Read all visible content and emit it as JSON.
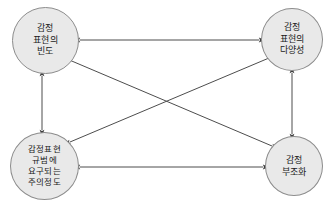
{
  "figure": {
    "type": "node-edge-diagram",
    "background_color": "#ffffff",
    "node_fill_color": "#e9e9e9",
    "node_border_color": "#8c8c8c",
    "edge_color": "#4d4d4d"
  },
  "nodes": [
    {
      "id": "frequency",
      "name": "감정 표현의 빈도",
      "lines": [
        "감정",
        "표현의",
        "빈도"
      ],
      "position": "top-left"
    },
    {
      "id": "variety",
      "name": "감정 표현의 다양성",
      "lines": [
        "감정",
        "표현의",
        "다양성"
      ],
      "position": "top-right"
    },
    {
      "id": "attention",
      "name": "감정표현 규범에 요구되는 주의정도",
      "lines": [
        "감정표현",
        "규범에",
        "요구되는",
        "주의정도"
      ],
      "position": "bottom-left"
    },
    {
      "id": "dissonance",
      "name": "감정 부조화",
      "lines": [
        "감정",
        "부조화"
      ],
      "position": "bottom-right"
    }
  ],
  "edges": [
    {
      "id": "frequency-variety",
      "from": "frequency",
      "to": "variety",
      "arrow": "double",
      "x1": 80,
      "y1": 40,
      "x2": 259,
      "y2": 40
    },
    {
      "id": "attention-dissonance",
      "from": "attention",
      "to": "dissonance",
      "arrow": "double",
      "x1": 80,
      "y1": 167,
      "x2": 263,
      "y2": 167
    },
    {
      "id": "frequency-attention",
      "from": "frequency",
      "to": "attention",
      "arrow": "double",
      "x1": 42,
      "y1": 76,
      "x2": 42,
      "y2": 130
    },
    {
      "id": "variety-dissonance",
      "from": "variety",
      "to": "dissonance",
      "arrow": "double",
      "x1": 292,
      "y1": 73,
      "x2": 292,
      "y2": 134
    },
    {
      "id": "frequency-dissonance",
      "from": "frequency",
      "to": "dissonance",
      "arrow": "double",
      "x1": 67,
      "y1": 59,
      "x2": 272,
      "y2": 146
    },
    {
      "id": "variety-attention",
      "from": "variety",
      "to": "attention",
      "arrow": "double",
      "x1": 269,
      "y1": 58,
      "x2": 70,
      "y2": 142
    }
  ]
}
